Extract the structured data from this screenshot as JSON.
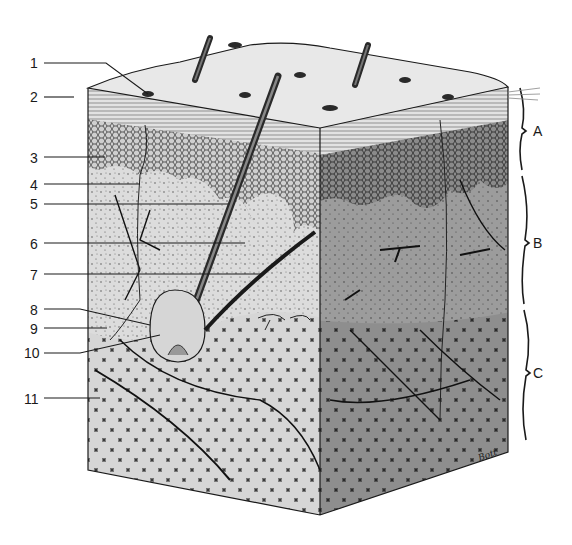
{
  "diagram": {
    "numbered_labels": [
      {
        "id": "1",
        "text": "1",
        "x": 30,
        "y": 56
      },
      {
        "id": "2",
        "text": "2",
        "x": 30,
        "y": 90
      },
      {
        "id": "3",
        "text": "3",
        "x": 30,
        "y": 151
      },
      {
        "id": "4",
        "text": "4",
        "x": 30,
        "y": 178
      },
      {
        "id": "5",
        "text": "5",
        "x": 30,
        "y": 197
      },
      {
        "id": "6",
        "text": "6",
        "x": 30,
        "y": 237
      },
      {
        "id": "7",
        "text": "7",
        "x": 30,
        "y": 268
      },
      {
        "id": "8",
        "text": "8",
        "x": 30,
        "y": 303
      },
      {
        "id": "9",
        "text": "9",
        "x": 30,
        "y": 322
      },
      {
        "id": "10",
        "text": "10",
        "x": 24,
        "y": 346
      },
      {
        "id": "11",
        "text": "11",
        "x": 24,
        "y": 392
      }
    ],
    "brackets": [
      {
        "id": "A",
        "text": "A",
        "x": 533,
        "y": 124
      },
      {
        "id": "B",
        "text": "B",
        "x": 533,
        "y": 236
      },
      {
        "id": "C",
        "text": "C",
        "x": 533,
        "y": 366
      }
    ],
    "signature": "Bott",
    "colors": {
      "ink": "#1a1a1a",
      "surface": "#e6e6e6",
      "epidermis_stripes": "#d4d4d4",
      "cell_layer": "#bdbdbd",
      "dermis_left": "#d8d8d8",
      "dermis_right": "#9a9a9a",
      "fat_left": "#d0d0d0",
      "fat_right": "#8f8f8f"
    }
  }
}
